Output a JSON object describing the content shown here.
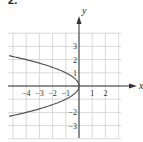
{
  "problem_number": "52.",
  "chart_data": {
    "type": "line",
    "title": "",
    "xlabel": "x",
    "ylabel": "y",
    "equation": "x = -y^2",
    "xlim": [
      -5,
      3
    ],
    "ylim": [
      -4,
      4
    ],
    "x_ticks": [
      "-4",
      "-3",
      "-2",
      "-1",
      "1",
      "2"
    ],
    "y_ticks": [
      "3",
      "2",
      "1",
      "-2",
      "-3"
    ],
    "grid": true,
    "series": [
      {
        "name": "parabola opening left",
        "points": [
          [
            -4.84,
            2.2
          ],
          [
            -4,
            2
          ],
          [
            -2.25,
            1.5
          ],
          [
            -1,
            1
          ],
          [
            -0.25,
            0.5
          ],
          [
            0,
            0
          ],
          [
            -0.25,
            -0.5
          ],
          [
            -1,
            -1
          ],
          [
            -2.25,
            -1.5
          ],
          [
            -4,
            -2
          ],
          [
            -4.84,
            -2.2
          ]
        ]
      }
    ],
    "colors": {
      "grid": "#cfcfcf",
      "axis": "#333333",
      "curve": "#555555"
    }
  }
}
